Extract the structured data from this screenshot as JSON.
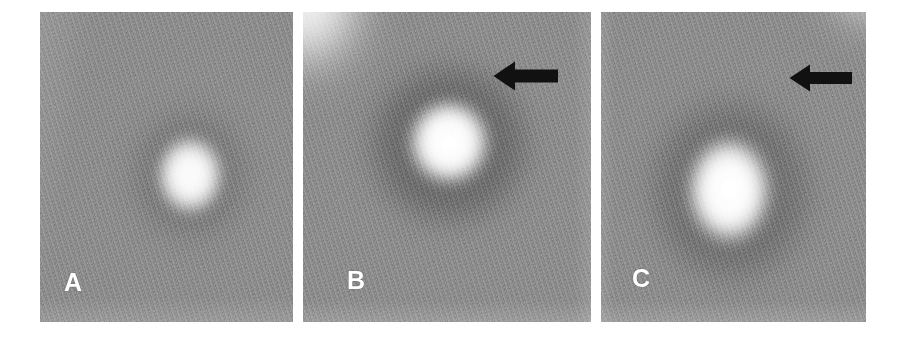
{
  "figure": {
    "type": "scientific-figure",
    "background_color": "#ffffff",
    "width": 909,
    "height": 346,
    "panel_background_gray": "#8e8e8e",
    "hot_spot_color": "#ffffff",
    "halo_color": "#6d6d6d",
    "label_color": "#ffffff",
    "arrow_color": "#111111"
  },
  "panels": [
    {
      "id": "panel-a",
      "label": "A",
      "x": 40,
      "y": 12,
      "width": 253,
      "height": 310,
      "label_x": 24,
      "label_y": 258,
      "has_arrow": false,
      "hot_spot": {
        "cx": 150,
        "cy": 163,
        "rx": 41,
        "ry": 48,
        "peak_intensity": 0.97
      },
      "halo": {
        "cx": 150,
        "cy": 163,
        "rx": 72,
        "ry": 80,
        "darkness": 0.16
      },
      "corner_glow": null
    },
    {
      "id": "panel-b",
      "label": "B",
      "x": 303,
      "y": 12,
      "width": 288,
      "height": 310,
      "label_x": 44,
      "label_y": 256,
      "has_arrow": true,
      "arrow": {
        "name": "left-arrow-annotation",
        "x": 190,
        "y": 47,
        "width": 66,
        "height": 34,
        "direction": "left"
      },
      "hot_spot": {
        "cx": 146,
        "cy": 130,
        "rx": 48,
        "ry": 50,
        "peak_intensity": 1.0
      },
      "halo": {
        "cx": 146,
        "cy": 132,
        "rx": 92,
        "ry": 92,
        "darkness": 0.3
      },
      "corner_glow": {
        "corner": "top-left",
        "intensity": 0.85
      }
    },
    {
      "id": "panel-c",
      "label": "C",
      "x": 601,
      "y": 12,
      "width": 265,
      "height": 310,
      "label_x": 31,
      "label_y": 254,
      "has_arrow": true,
      "arrow": {
        "name": "left-arrow-annotation",
        "x": 188,
        "y": 50,
        "width": 64,
        "height": 32,
        "direction": "left"
      },
      "hot_spot": {
        "cx": 128,
        "cy": 178,
        "rx": 49,
        "ry": 62,
        "peak_intensity": 1.0
      },
      "halo": {
        "cx": 130,
        "cy": 178,
        "rx": 92,
        "ry": 104,
        "darkness": 0.26
      },
      "corner_glow": {
        "corner": "top-right",
        "intensity": 0.55
      }
    }
  ]
}
